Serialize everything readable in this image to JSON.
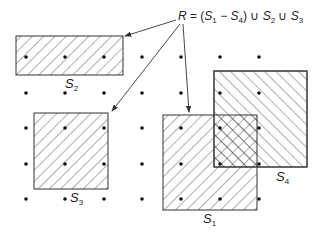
{
  "equation": {
    "R": "R",
    "eq": " = (",
    "s1": "S",
    "s1sub": "1",
    "minus": " − ",
    "s4": "S",
    "s4sub": "4",
    "close": ") ∪ ",
    "s2": "S",
    "s2sub": "2",
    "union": " ∪ ",
    "s3": "S",
    "s3sub": "3"
  },
  "sets": [
    {
      "name": "S",
      "sub": "1",
      "hatch": "forward"
    },
    {
      "name": "S",
      "sub": "2",
      "hatch": "forward"
    },
    {
      "name": "S",
      "sub": "3",
      "hatch": "forward"
    },
    {
      "name": "S",
      "sub": "4",
      "hatch": "backward"
    }
  ],
  "grid": {
    "columns": 7,
    "rows": 5
  },
  "colors": {
    "stroke": "#333333",
    "dot": "#111111"
  }
}
